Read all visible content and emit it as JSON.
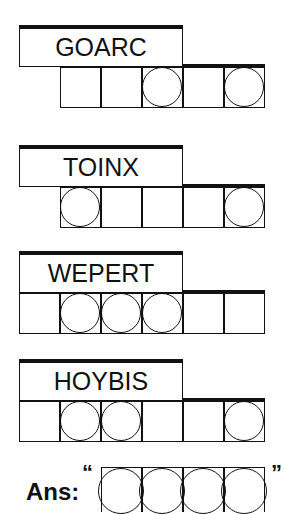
{
  "puzzle": {
    "words": [
      {
        "scramble": "GOARC",
        "cells": 5,
        "start_col": 1,
        "circles": [
          3,
          5
        ],
        "top": 25
      },
      {
        "scramble": "TOINX",
        "cells": 5,
        "start_col": 1,
        "circles": [
          1,
          5
        ],
        "top": 145
      },
      {
        "scramble": "WEPERT",
        "cells": 6,
        "start_col": 0,
        "circles": [
          2,
          3,
          4
        ],
        "top": 251
      },
      {
        "scramble": "HOYBIS",
        "cells": 6,
        "start_col": 0,
        "circles": [
          2,
          3,
          6
        ],
        "top": 359
      }
    ],
    "answer": {
      "label": "Ans:",
      "open_quote": "“",
      "close_quote": "”",
      "cells": 4,
      "all_circled": true
    }
  }
}
